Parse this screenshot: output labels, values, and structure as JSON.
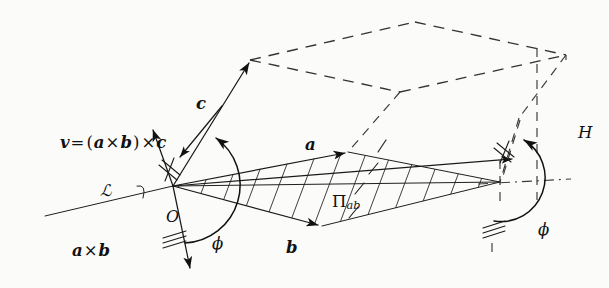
{
  "figure": {
    "background_color": "#fbfbfa",
    "ink_color": "#111111"
  },
  "labels": {
    "v_expression": {
      "lead": "v",
      "equals": "=",
      "open_paren": "(",
      "a": "a",
      "cross1": "×",
      "b": "b",
      "close_paren": ")",
      "cross2": "×",
      "c": "c"
    },
    "vector_c": "c",
    "vector_a": "a",
    "vector_b": "b",
    "a_cross_b": {
      "a": "a",
      "cross": "×",
      "b": "b"
    },
    "line_l": "ℒ",
    "origin": "O",
    "plane_pi": {
      "symbol": "Π",
      "subscript": "ab"
    },
    "phi_left": "ϕ",
    "phi_right": "ϕ",
    "height_h": "H"
  },
  "geometry": {
    "origin_point": [
      173,
      186
    ],
    "right_vertex": [
      500,
      182
    ],
    "parallelogram_vertices": [
      [
        173,
        186
      ],
      [
        348,
        152
      ],
      [
        500,
        182
      ],
      [
        322,
        226
      ]
    ],
    "c_arrow_tip": [
      250,
      60
    ],
    "v_arrow_tip": [
      152,
      128
    ],
    "a_cross_b_arrow_tip": [
      190,
      272
    ],
    "phi_angle_symbol": "ϕ",
    "hatch_count_plane": 11,
    "dashed_solid_name": "parallelepiped"
  }
}
